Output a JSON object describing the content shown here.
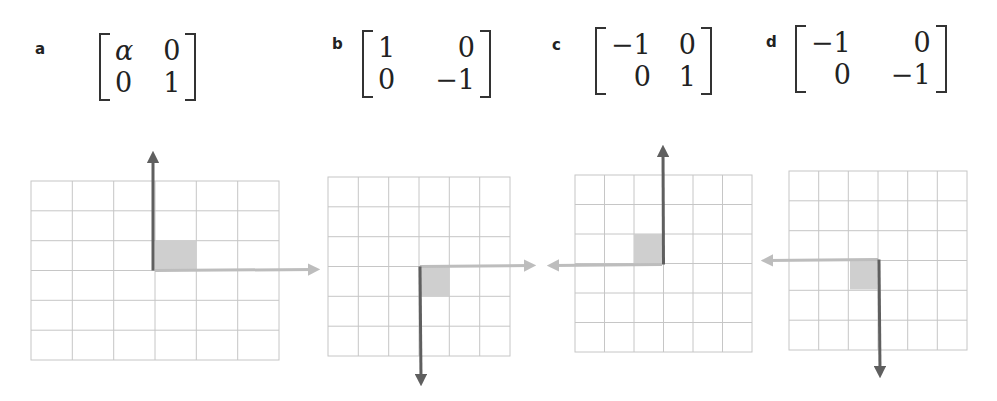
{
  "panels": [
    {
      "id": "a",
      "label": "a",
      "matrix": [
        [
          "α",
          "0"
        ],
        [
          "0",
          "1"
        ]
      ],
      "description": "Horizontal scaling by alpha"
    },
    {
      "id": "b",
      "label": "b",
      "matrix": [
        [
          "1",
          "0"
        ],
        [
          "0",
          "−1"
        ]
      ],
      "description": "Reflection across horizontal axis"
    },
    {
      "id": "c",
      "label": "c",
      "matrix": [
        [
          "−1",
          "0"
        ],
        [
          "0",
          "1"
        ]
      ],
      "description": "Reflection across vertical axis"
    },
    {
      "id": "d",
      "label": "d",
      "matrix": [
        [
          "−1",
          "0"
        ],
        [
          "0",
          "−1"
        ]
      ],
      "description": "Reflection through origin"
    }
  ],
  "colors": {
    "grid_line": "#c6c6c6",
    "unit_square": "#cfcfcf",
    "basis_e1_arrow": "#bdbdbd",
    "basis_e2_arrow": "#5f5f5f",
    "text": "#222222"
  }
}
